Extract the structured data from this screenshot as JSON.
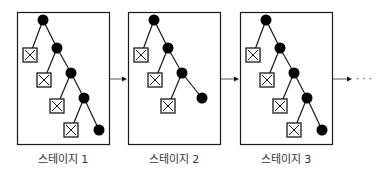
{
  "diagram": {
    "stages": [
      {
        "label": "스테이지 1",
        "x": 17,
        "levels": 4
      },
      {
        "label": "스테이지 2",
        "x": 128,
        "levels": 3
      },
      {
        "label": "스테이지 3",
        "x": 240,
        "levels": 4
      }
    ],
    "continuation": "· · ·",
    "colors": {
      "stroke": "#1a1a1a",
      "node": "#000000",
      "background": "#ffffff"
    }
  }
}
